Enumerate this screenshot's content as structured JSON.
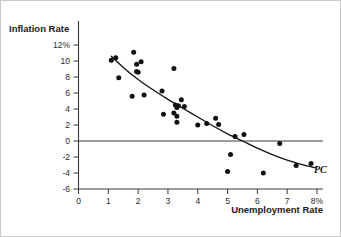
{
  "figure": {
    "caption": "",
    "border_color": "#c8c8c8",
    "background": "#ffffff"
  },
  "labels": {
    "y_axis_title": "Inflation Rate",
    "x_axis_title": "Unemployment Rate",
    "curve_label": "PC"
  },
  "chart_data": {
    "type": "scatter",
    "title": "",
    "subtitle": "",
    "xlabel": "Unemployment Rate",
    "ylabel": "Inflation Rate",
    "xlim": [
      0,
      8
    ],
    "ylim": [
      -6,
      12
    ],
    "grid": false,
    "legend": null,
    "x_ticks": [
      "0",
      "1",
      "2",
      "3",
      "4",
      "5",
      "6",
      "7",
      "8%"
    ],
    "x_tick_values": [
      0,
      1,
      2,
      3,
      4,
      5,
      6,
      7,
      8
    ],
    "y_ticks": [
      "12%",
      "10",
      "8",
      "6",
      "4",
      "2",
      "0",
      "-2",
      "-4",
      "-6"
    ],
    "y_tick_values": [
      12,
      10,
      8,
      6,
      4,
      2,
      0,
      -2,
      -4,
      -6
    ],
    "zero_line": 0,
    "annotations": [
      {
        "text": "PC",
        "x": 8.0,
        "y": -3.4,
        "style": "italic"
      }
    ],
    "series": [
      {
        "name": "Observations",
        "type": "scatter",
        "marker": "filled-circle",
        "color": "#111111",
        "points": [
          [
            1.1,
            10.1
          ],
          [
            1.25,
            10.4
          ],
          [
            1.35,
            7.9
          ],
          [
            1.8,
            5.6
          ],
          [
            1.85,
            11.1
          ],
          [
            1.95,
            9.6
          ],
          [
            1.95,
            8.7
          ],
          [
            2.0,
            8.6
          ],
          [
            2.1,
            9.9
          ],
          [
            2.2,
            5.75
          ],
          [
            2.8,
            6.25
          ],
          [
            2.85,
            3.35
          ],
          [
            3.2,
            9.05
          ],
          [
            3.2,
            3.5
          ],
          [
            3.25,
            4.5
          ],
          [
            3.3,
            4.3
          ],
          [
            3.3,
            4.2
          ],
          [
            3.35,
            4.4
          ],
          [
            3.3,
            3.1
          ],
          [
            3.3,
            2.35
          ],
          [
            3.45,
            5.15
          ],
          [
            3.55,
            4.3
          ],
          [
            4.0,
            2.0
          ],
          [
            4.3,
            2.2
          ],
          [
            4.6,
            2.85
          ],
          [
            4.7,
            2.05
          ],
          [
            5.0,
            -3.8
          ],
          [
            5.1,
            -1.7
          ],
          [
            5.25,
            0.55
          ],
          [
            5.55,
            0.8
          ],
          [
            6.2,
            -4.0
          ],
          [
            6.75,
            -0.3
          ],
          [
            7.3,
            -3.05
          ],
          [
            7.8,
            -2.8
          ]
        ]
      },
      {
        "name": "Phillips Curve",
        "type": "line",
        "color": "#111111",
        "label": "PC",
        "points": [
          [
            1.1,
            10.6
          ],
          [
            1.5,
            9.2
          ],
          [
            2.0,
            7.7
          ],
          [
            2.5,
            6.4
          ],
          [
            3.0,
            5.2
          ],
          [
            3.5,
            4.1
          ],
          [
            4.0,
            3.0
          ],
          [
            4.5,
            1.9
          ],
          [
            5.0,
            0.9
          ],
          [
            5.5,
            0.0
          ],
          [
            6.0,
            -0.9
          ],
          [
            6.5,
            -1.7
          ],
          [
            7.0,
            -2.4
          ],
          [
            7.5,
            -2.95
          ],
          [
            7.95,
            -3.35
          ]
        ]
      }
    ]
  }
}
